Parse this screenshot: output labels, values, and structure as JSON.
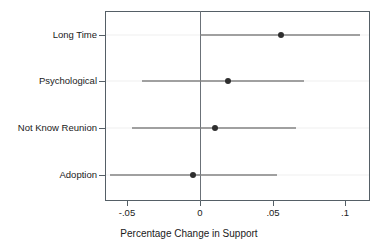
{
  "chart_data": {
    "type": "scatter",
    "subtype": "coefficient-forest-plot",
    "title": "",
    "xlabel": "Percentage Change in Support",
    "ylabel": "",
    "categories": [
      "Long Time",
      "Psychological",
      "Not Know Reunion",
      "Adoption"
    ],
    "xlim": [
      -0.0655,
      0.1172
    ],
    "ylim": [
      0,
      5
    ],
    "xticks": [
      -0.05,
      0,
      0.05,
      0.1
    ],
    "xticklabels": [
      "-.05",
      "0",
      ".05",
      ".1"
    ],
    "grid": false,
    "legend": null,
    "reference_line": {
      "x": 0,
      "color": "#6b7178"
    },
    "point_color": "#2e2e2e",
    "line_color": "#4a4a4a",
    "frame_color": "#555f66",
    "series": [
      {
        "name": "Estimate with 95% CI",
        "points": [
          {
            "category": "Long Time",
            "estimate": 0.056,
            "ci_low": 0.0,
            "ci_high": 0.11
          },
          {
            "category": "Psychological",
            "estimate": 0.019,
            "ci_low": -0.04,
            "ci_high": 0.072
          },
          {
            "category": "Not Know Reunion",
            "estimate": 0.01,
            "ci_low": -0.047,
            "ci_high": 0.066
          },
          {
            "category": "Adoption",
            "estimate": -0.005,
            "ci_low": -0.062,
            "ci_high": 0.053
          }
        ]
      }
    ]
  },
  "axis": {
    "x_title": "Percentage Change in Support",
    "x_tick_labels": [
      "-.05",
      "0",
      ".05",
      ".1"
    ],
    "y_tick_labels": [
      "Long Time",
      "Psychological",
      "Not Know Reunion",
      "Adoption"
    ]
  }
}
